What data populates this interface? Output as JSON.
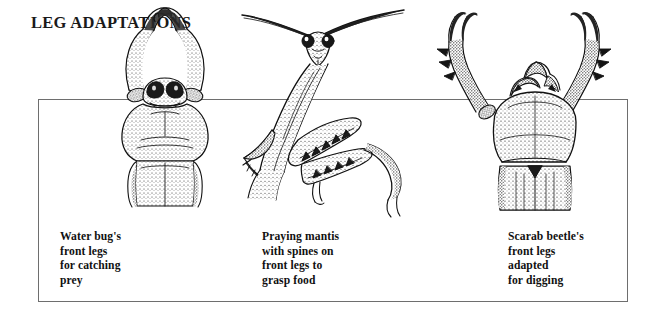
{
  "title": "LEG ADAPTATIONS",
  "frame": {
    "label": "content-border-box",
    "color": "#6e6e6e"
  },
  "colors": {
    "ink": "#111111",
    "border": "#6e6e6e",
    "background": "#ffffff"
  },
  "panels": [
    {
      "id": "water-bug",
      "figure_name": "water-bug-illustration",
      "caption": "Water bug's\nfront legs\nfor catching\nprey",
      "adaptation": "raptorial front legs for catching prey"
    },
    {
      "id": "praying-mantis",
      "figure_name": "praying-mantis-illustration",
      "caption": "Praying mantis\nwith spines on\nfront legs to\ngrasp food",
      "adaptation": "spined raptorial front legs to grasp food"
    },
    {
      "id": "scarab-beetle",
      "figure_name": "scarab-beetle-illustration",
      "caption": "Scarab beetle's\nfront legs\nadapted\nfor digging",
      "adaptation": "fossorial toothed front legs for digging"
    }
  ]
}
